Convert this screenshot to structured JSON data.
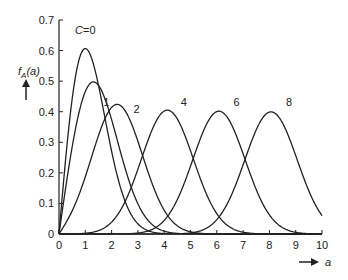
{
  "chart_data": {
    "type": "line",
    "title": "",
    "xlabel": "a",
    "ylabel": "f_A(a)",
    "xlim": [
      0,
      10
    ],
    "ylim": [
      0,
      0.7
    ],
    "x_ticks": [
      "0",
      "1",
      "2",
      "3",
      "4",
      "5",
      "6",
      "7",
      "8",
      "9",
      "10"
    ],
    "y_ticks": [
      "0",
      "0.1",
      "0.2",
      "0.3",
      "0.4",
      "0.5",
      "0.6",
      "0.7"
    ],
    "grid": false,
    "legend": "inline labels",
    "distribution": "Rice (sigma = 1)",
    "series": [
      {
        "name": "C=0",
        "C": 0,
        "label": "C=0",
        "peak_a": 1.0,
        "peak_value": 0.61,
        "label_pos": [
          1.0,
          0.655
        ]
      },
      {
        "name": "1",
        "C": 1,
        "label": "1",
        "peak_a": 1.3,
        "peak_value": 0.5,
        "label_pos": [
          1.8,
          0.42
        ]
      },
      {
        "name": "2",
        "C": 2,
        "label": "2",
        "peak_a": 2.2,
        "peak_value": 0.42,
        "label_pos": [
          2.95,
          0.395
        ]
      },
      {
        "name": "4",
        "C": 4,
        "label": "4",
        "peak_a": 4.1,
        "peak_value": 0.4,
        "label_pos": [
          4.75,
          0.42
        ]
      },
      {
        "name": "6",
        "C": 6,
        "label": "6",
        "peak_a": 6.1,
        "peak_value": 0.4,
        "label_pos": [
          6.75,
          0.42
        ]
      },
      {
        "name": "8",
        "C": 8,
        "label": "8",
        "peak_a": 8.1,
        "peak_value": 0.4,
        "label_pos": [
          8.75,
          0.42
        ]
      }
    ]
  },
  "axis": {
    "ylabel_main": "f",
    "ylabel_sub": "A",
    "ylabel_arg": "(a)",
    "xlabel": "a"
  }
}
